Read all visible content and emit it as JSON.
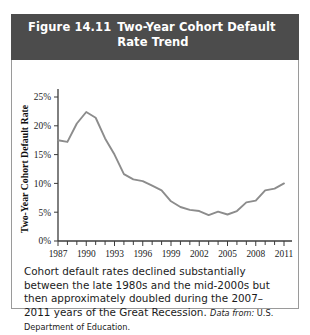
{
  "figure": {
    "number": "Figure 14.11",
    "title": "Two-Year Cohort Default\nRate Trend",
    "header_bg": "#4c4c4c",
    "line_color": "#8c8c8c"
  },
  "caption": {
    "body": "Cohort default rates declined substantially between the late 1980s and the mid-2000s but then approximately doubled during the 2007–2011 years of the Great Recession.",
    "source_lead": "Data from:",
    "source_text": "U.S. Department of Education."
  },
  "chart_data": {
    "type": "line",
    "title": "Two-Year Cohort Default Rate Trend",
    "xlabel": "Year",
    "ylabel": "Two-Year Cohort Default Rate",
    "xlim": [
      1987,
      2011
    ],
    "ylim": [
      0,
      25
    ],
    "grid": false,
    "legend": false,
    "y_tick_labels": [
      "0%",
      "5%",
      "10%",
      "15%",
      "20%",
      "25%"
    ],
    "y_tick_values": [
      0,
      5,
      10,
      15,
      20,
      25
    ],
    "x_tick_labels": [
      "1987",
      "1990",
      "1993",
      "1996",
      "1999",
      "2002",
      "2005",
      "2008",
      "2011"
    ],
    "x_tick_values": [
      1987,
      1990,
      1993,
      1996,
      1999,
      2002,
      2005,
      2008,
      2011
    ],
    "x_minor_ticks": [
      1988,
      1989,
      1991,
      1992,
      1994,
      1995,
      1997,
      1998,
      2000,
      2001,
      2003,
      2004,
      2006,
      2007,
      2009,
      2010
    ],
    "x": [
      1987,
      1988,
      1989,
      1990,
      1991,
      1992,
      1993,
      1994,
      1995,
      1996,
      1997,
      1998,
      1999,
      2000,
      2001,
      2002,
      2003,
      2004,
      2005,
      2006,
      2007,
      2008,
      2009,
      2010,
      2011
    ],
    "values": [
      17.5,
      17.2,
      20.4,
      22.4,
      21.4,
      17.8,
      15.0,
      11.6,
      10.7,
      10.4,
      9.6,
      8.8,
      6.9,
      5.9,
      5.4,
      5.2,
      4.5,
      5.1,
      4.6,
      5.2,
      6.7,
      7.0,
      8.8,
      9.1,
      10.0
    ],
    "series": [
      {
        "name": "Two-Year Cohort Default Rate",
        "color": "#8c8c8c",
        "values": [
          17.5,
          17.2,
          20.4,
          22.4,
          21.4,
          17.8,
          15.0,
          11.6,
          10.7,
          10.4,
          9.6,
          8.8,
          6.9,
          5.9,
          5.4,
          5.2,
          4.5,
          5.1,
          4.6,
          5.2,
          6.7,
          7.0,
          8.8,
          9.1,
          10.0
        ]
      }
    ]
  }
}
